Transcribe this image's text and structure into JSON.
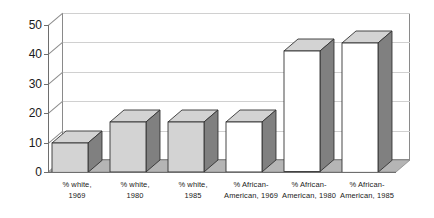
{
  "chart_data": {
    "type": "bar",
    "title": "",
    "subtitle": "",
    "xlabel": "",
    "ylabel": "",
    "ylim": [
      0,
      50
    ],
    "ytick_step": 10,
    "yticks": [
      0,
      10,
      20,
      30,
      40,
      50
    ],
    "grid": true,
    "legend": "none",
    "style": "3d-column",
    "categories": [
      "% white, 1969",
      "% white, 1980",
      "% white, 1985",
      "% African-American, 1969",
      "% African-American, 1980",
      "% African-American, 1985"
    ],
    "category_lines": [
      [
        "% white,",
        "1969"
      ],
      [
        "% white,",
        "1980"
      ],
      [
        "% white,",
        "1985"
      ],
      [
        "% African-",
        "American, 1969"
      ],
      [
        "% African-",
        "American, 1980"
      ],
      [
        "% African-",
        "American, 1985"
      ]
    ],
    "values": [
      10,
      17,
      17,
      17,
      41,
      44
    ],
    "bar_face_colors": [
      "#d3d3d3",
      "#d3d3d3",
      "#d3d3d3",
      "#ffffff",
      "#ffffff",
      "#ffffff"
    ],
    "bar_side_color": "#808080",
    "bar_top_color": "#d3d3d3",
    "bar_outline_color": "#333333"
  },
  "axis": {
    "ytick_labels": [
      "0",
      "10",
      "20",
      "30",
      "40",
      "50"
    ]
  },
  "colors": {
    "background": "#ffffff",
    "frame": "#8a8a8a",
    "axis": "#6e6e6e",
    "grid": "#d0d0d0",
    "floor_top": "#b5b5b5",
    "floor_front": "#7d7d7d",
    "text": "#1a1a1a"
  }
}
